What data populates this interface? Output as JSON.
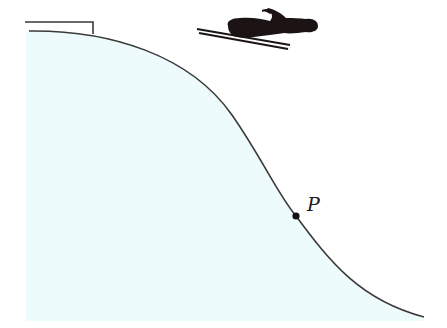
{
  "diagram": {
    "colors": {
      "background": "#ffffff",
      "hill_fill": "#eefbfd",
      "curve_stroke": "#3a3a3a",
      "skier": "#1c1414",
      "point": "#111111"
    },
    "elements": {
      "ramp": {
        "label": ""
      },
      "skier": {
        "label": ""
      },
      "hill_curve": {
        "label": ""
      },
      "point": {
        "label": "P",
        "x": 296,
        "y": 216
      }
    }
  }
}
